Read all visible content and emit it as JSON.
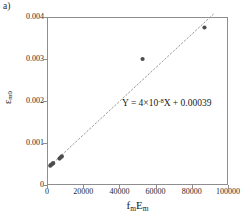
{
  "panel": {
    "label": "a)"
  },
  "equation": {
    "prefix": "Y = 4×10",
    "exponent": "-8",
    "suffix": "X + 0.00039"
  },
  "axis": {
    "x_label_main": "f",
    "x_label_sub1": "m",
    "x_label_main2": "E",
    "x_label_sub2": "m",
    "y_label_main": "ε",
    "y_label_sub": "m0"
  },
  "chart_data": {
    "type": "scatter",
    "title": "",
    "xlabel": "fmEm",
    "ylabel": "εm0",
    "xlim": [
      0,
      100000
    ],
    "ylim": [
      0,
      0.004
    ],
    "grid": false,
    "legend": "none",
    "xticks": [
      0,
      20000,
      40000,
      60000,
      80000,
      100000
    ],
    "xticklabels": [
      "0",
      "20000",
      "40000",
      "60000",
      "80000",
      "100000"
    ],
    "yticks": [
      0,
      0.001,
      0.002,
      0.003,
      0.004
    ],
    "yticklabels": [
      "0",
      "0.001",
      "0.002",
      "0.003",
      "0.004"
    ],
    "series": [
      {
        "name": "measured",
        "marker": "circle",
        "color": "#4d4d4d",
        "points": [
          {
            "x": 1800,
            "y": 0.00046
          },
          {
            "x": 2300,
            "y": 0.00048
          },
          {
            "x": 2900,
            "y": 0.0005
          },
          {
            "x": 3400,
            "y": 0.00052
          },
          {
            "x": 6900,
            "y": 0.00063
          },
          {
            "x": 7600,
            "y": 0.00066
          },
          {
            "x": 8200,
            "y": 0.00068
          },
          {
            "x": 52800,
            "y": 0.003
          },
          {
            "x": 87000,
            "y": 0.00375
          }
        ]
      }
    ],
    "trendline": {
      "name": "linear fit",
      "style": "dotted",
      "color": "#9a9a9a",
      "slope": 4e-08,
      "intercept": 0.00039,
      "x_start": 2000,
      "x_end": 92000,
      "equation": "Y = 4×10^-8 X + 0.00039"
    }
  }
}
